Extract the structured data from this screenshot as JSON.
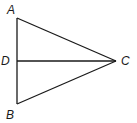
{
  "diagram": {
    "title": "",
    "points": {
      "A": {
        "label": "A",
        "x": 17,
        "y": 18,
        "lx": 7,
        "ly": 14
      },
      "B": {
        "label": "B",
        "x": 17,
        "y": 104,
        "lx": 6,
        "ly": 119
      },
      "C": {
        "label": "C",
        "x": 116,
        "y": 61,
        "lx": 121,
        "ly": 65
      },
      "D": {
        "label": "D",
        "x": 17,
        "y": 61,
        "lx": 1,
        "ly": 65
      }
    },
    "segments": [
      {
        "from": "A",
        "to": "B"
      },
      {
        "from": "A",
        "to": "C"
      },
      {
        "from": "B",
        "to": "C"
      },
      {
        "from": "D",
        "to": "C"
      }
    ]
  }
}
